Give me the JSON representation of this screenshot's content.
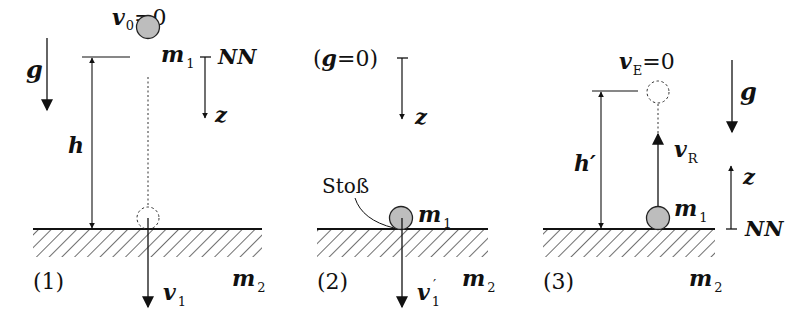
{
  "figure": {
    "colors": {
      "ink": "#111111",
      "ball_fill": "#bdbdbd",
      "background": "#ffffff"
    },
    "panels": [
      {
        "id": "1",
        "number_label": "(1)",
        "gravity_label": "g",
        "v0_label": "v",
        "v0_sub": "0",
        "v0_eq": "=0",
        "mass1_label": "m",
        "mass1_sub": "1",
        "height_label": "h",
        "reference_label": "NN",
        "axis_label": "z",
        "velocity_label": "v",
        "velocity_sub": "1",
        "mass2_label": "m",
        "mass2_sub": "2"
      },
      {
        "id": "2",
        "number_label": "(2)",
        "gravity_label": "(g=0)",
        "axis_label": "z",
        "impact_label": "Stoß",
        "mass1_label": "m",
        "mass1_sub": "1",
        "velocity_label": "v",
        "velocity_sub": "1",
        "velocity_prime": "′",
        "mass2_label": "m",
        "mass2_sub": "2"
      },
      {
        "id": "3",
        "number_label": "(3)",
        "vE_label": "v",
        "vE_sub": "E",
        "vE_eq": "=0",
        "gravity_label": "g",
        "height_label": "h′",
        "velocity_label": "v",
        "velocity_sub": "R",
        "axis_label": "z",
        "mass1_label": "m",
        "mass1_sub": "1",
        "reference_label": "NN",
        "mass2_label": "m",
        "mass2_sub": "2"
      }
    ]
  }
}
